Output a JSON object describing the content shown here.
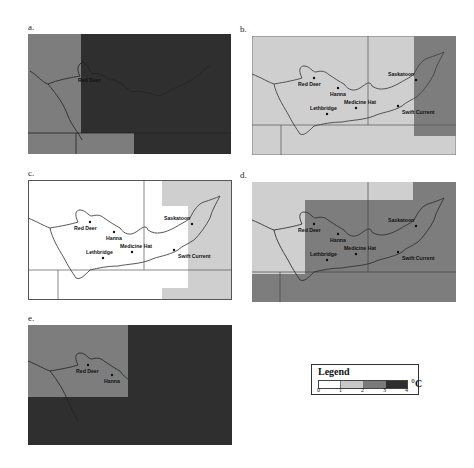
{
  "figure": {
    "panels": [
      {
        "id": "a",
        "label": "a."
      },
      {
        "id": "b",
        "label": "b."
      },
      {
        "id": "c",
        "label": "c."
      },
      {
        "id": "d",
        "label": "d."
      },
      {
        "id": "e",
        "label": "e."
      }
    ],
    "cities": {
      "red_deer": "Red Deer",
      "hanna": "Hanna",
      "saskatoon": "Saskatoon",
      "lethbridge": "Lethbridge",
      "medicine_hat": "Medicine Hat",
      "swift_current": "Swift Current"
    }
  },
  "legend": {
    "title": "Legend",
    "unit": "°C",
    "ticks": [
      "0",
      "1",
      "2",
      "3",
      "4"
    ],
    "classes": [
      {
        "range": "0-1",
        "color": "#ffffff"
      },
      {
        "range": "1-2",
        "color": "#c8c8c8"
      },
      {
        "range": "2-3",
        "color": "#7a7a7a"
      },
      {
        "range": "3-4",
        "color": "#2e2e2e"
      }
    ]
  },
  "colors": {
    "class0": "#ffffff",
    "class1": "#cfcfcf",
    "class2": "#7d7d7d",
    "class3": "#2f2f2f",
    "border": "#4a4a4a"
  }
}
